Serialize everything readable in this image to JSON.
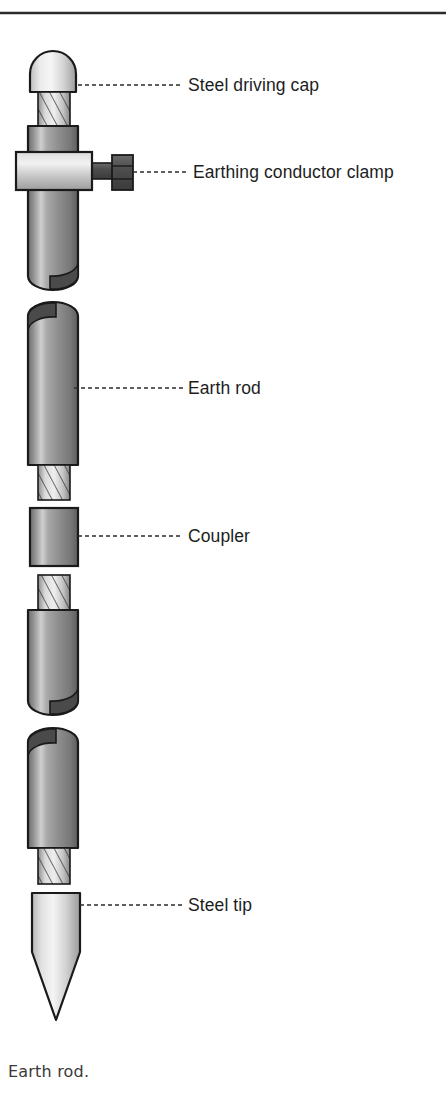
{
  "page": {
    "width": 446,
    "height": 1103,
    "background_color": "#ffffff",
    "top_rule": {
      "name": "page-top-rule",
      "x1": 0,
      "y1": 13,
      "x2": 446,
      "y2": 13,
      "color": "#2b2b2b",
      "thickness": 2.5
    }
  },
  "figure": {
    "caption": "Earth rod.",
    "caption_x": 8,
    "caption_y": 1077,
    "axis_x": 52,
    "colors": {
      "outline": "#1a1a1a",
      "metal_dark": "#5f5f5f",
      "metal_mid": "#9a9a9a",
      "metal_light": "#e8e8e8",
      "metal_highlight": "#f4f4f4",
      "bolt_dark": "#4a4a4a",
      "leader_line": "#2b2b2b",
      "label_color": "#1d1d1d",
      "caption_color": "#3a3a3a"
    }
  },
  "labels": [
    {
      "id": "steel-driving-cap",
      "text": "Steel driving cap",
      "text_x": 188,
      "text_y": 91,
      "leader": {
        "x1": 78,
        "y1": 85,
        "x2": 183,
        "y2": 85
      }
    },
    {
      "id": "earthing-conductor-clamp",
      "text": "Earthing conductor clamp",
      "text_x": 193,
      "text_y": 178,
      "leader": {
        "x1": 122,
        "y1": 172,
        "x2": 188,
        "y2": 172
      }
    },
    {
      "id": "earth-rod",
      "text": "Earth rod",
      "text_x": 188,
      "text_y": 394,
      "leader": {
        "x1": 74,
        "y1": 388,
        "x2": 183,
        "y2": 388
      }
    },
    {
      "id": "coupler",
      "text": "Coupler",
      "text_x": 188,
      "text_y": 542,
      "leader": {
        "x1": 78,
        "y1": 536,
        "x2": 183,
        "y2": 536
      }
    },
    {
      "id": "steel-tip",
      "text": "Steel tip",
      "text_x": 188,
      "text_y": 911,
      "leader": {
        "x1": 82,
        "y1": 905,
        "x2": 183,
        "y2": 905
      }
    }
  ],
  "parts": [
    {
      "id": "driving-cap",
      "name": "steel-driving-cap",
      "type": "dome",
      "y_top": 52,
      "y_bottom": 92,
      "x_left": 30,
      "x_right": 76
    },
    {
      "id": "thread-1",
      "name": "threaded-stud-upper",
      "type": "thread",
      "y_top": 92,
      "y_bottom": 126,
      "x_left": 38,
      "x_right": 70
    },
    {
      "id": "rod-1",
      "name": "earth-rod-segment-1",
      "type": "rod",
      "y_top": 126,
      "y_bottom": 290,
      "x_left": 28,
      "x_right": 78
    },
    {
      "id": "clamp-collar",
      "name": "earthing-conductor-collar",
      "type": "collar",
      "y_top": 152,
      "y_bottom": 190,
      "x_left": 16,
      "x_right": 92
    },
    {
      "id": "clamp-bolt",
      "name": "earthing-conductor-bolt",
      "type": "bolt",
      "y_top": 155,
      "y_bottom": 190,
      "x_left": 92,
      "x_right": 133
    },
    {
      "id": "rod-2",
      "name": "earth-rod-segment-2",
      "type": "rod",
      "y_top": 302,
      "y_bottom": 465,
      "x_left": 28,
      "x_right": 78
    },
    {
      "id": "thread-2",
      "name": "threaded-stud-2",
      "type": "thread",
      "y_top": 465,
      "y_bottom": 500,
      "x_left": 38,
      "x_right": 70
    },
    {
      "id": "coupler",
      "name": "coupler",
      "type": "coupler",
      "y_top": 508,
      "y_bottom": 566,
      "x_left": 30,
      "x_right": 78
    },
    {
      "id": "thread-3",
      "name": "threaded-stud-3",
      "type": "thread",
      "y_top": 575,
      "y_bottom": 610,
      "x_left": 38,
      "x_right": 70
    },
    {
      "id": "rod-3",
      "name": "earth-rod-segment-3",
      "type": "rod",
      "y_top": 610,
      "y_bottom": 715,
      "x_left": 28,
      "x_right": 78
    },
    {
      "id": "rod-4",
      "name": "earth-rod-segment-4",
      "type": "rod",
      "y_top": 728,
      "y_bottom": 848,
      "x_left": 28,
      "x_right": 78
    },
    {
      "id": "thread-4",
      "name": "threaded-stud-lower",
      "type": "thread",
      "y_top": 848,
      "y_bottom": 884,
      "x_left": 38,
      "x_right": 70
    },
    {
      "id": "steel-tip",
      "name": "steel-tip",
      "type": "tip",
      "y_top": 893,
      "y_bottom": 1020,
      "x_left": 32,
      "x_right": 80
    }
  ]
}
